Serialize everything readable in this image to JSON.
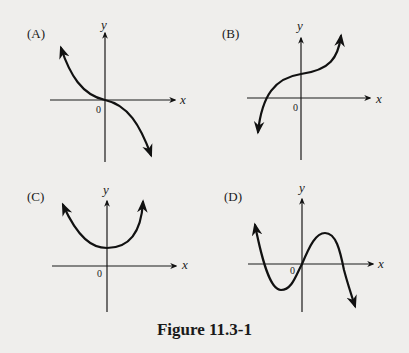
{
  "figure": {
    "caption": "Figure 11.3-1",
    "panels": [
      {
        "label": "(A)",
        "x_axis_label": "x",
        "y_axis_label": "y",
        "origin_label": "0",
        "description": "Decreasing cubic-like curve through origin, rising to upper-left and falling to lower-right, flat at origin"
      },
      {
        "label": "(B)",
        "x_axis_label": "x",
        "y_axis_label": "y",
        "origin_label": "0",
        "description": "Increasing cubic-like curve with inflection above origin on y-axis, crossing x-axis left of origin"
      },
      {
        "label": "(C)",
        "x_axis_label": "x",
        "y_axis_label": "y",
        "origin_label": "0",
        "description": "Upward-opening parabola with vertex on positive y-axis"
      },
      {
        "label": "(D)",
        "x_axis_label": "x",
        "y_axis_label": "y",
        "origin_label": "0",
        "description": "Negative-leading cubic through origin with local min left of origin below x-axis and local max right of origin above x-axis"
      }
    ]
  },
  "colors": {
    "background": "#efeeec",
    "ink": "#1a1a1a"
  }
}
